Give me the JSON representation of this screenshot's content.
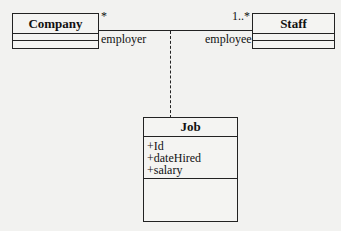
{
  "diagram": {
    "type": "UML class diagram with association class",
    "classes": [
      {
        "name": "Company",
        "attributes": [],
        "operations": []
      },
      {
        "name": "Staff",
        "attributes": [],
        "operations": []
      },
      {
        "name": "Job",
        "attributes": [
          "+Id",
          "+dateHired",
          "+salary"
        ],
        "operations": []
      }
    ],
    "association": {
      "from": "Company",
      "to": "Staff",
      "from_multiplicity": "*",
      "to_multiplicity": "1..*",
      "from_role": "employer",
      "to_role": "employee",
      "association_class": "Job"
    }
  }
}
